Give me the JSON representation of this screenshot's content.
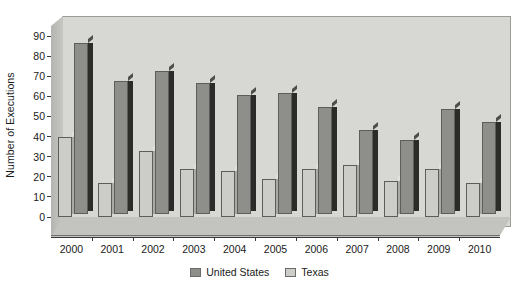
{
  "chart_data": {
    "type": "bar",
    "title": "",
    "subtitle": "",
    "xlabel": "",
    "ylabel": "Number of Executions",
    "ylim": [
      0,
      90
    ],
    "ytick_step": 10,
    "yticks": [
      90,
      80,
      70,
      60,
      50,
      40,
      30,
      20,
      10,
      0
    ],
    "grid": false,
    "legend_position": "bottom-center",
    "categories": [
      "2000",
      "2001",
      "2002",
      "2003",
      "2004",
      "2005",
      "2006",
      "2007",
      "2008",
      "2009",
      "2010"
    ],
    "series": [
      {
        "name": "United States",
        "color": "#8e8e8b",
        "values": [
          85,
          66,
          71,
          65,
          59,
          60,
          53,
          42,
          37,
          52,
          46
        ]
      },
      {
        "name": "Texas",
        "color": "#ccccc9",
        "values": [
          40,
          17,
          33,
          24,
          23,
          19,
          24,
          26,
          18,
          24,
          17
        ]
      }
    ],
    "annotations": []
  },
  "legend": {
    "items": [
      {
        "label": "United States",
        "swatch_color": "#8e8e8b"
      },
      {
        "label": "Texas",
        "swatch_color": "#ccccc9"
      }
    ]
  },
  "axis": {
    "y_title": "Number of Executions"
  }
}
